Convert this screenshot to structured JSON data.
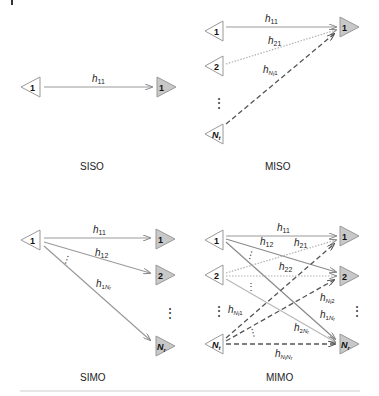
{
  "colors": {
    "tx_fill": "#ffffff",
    "rx_fill": "#c8c8c8",
    "stroke": "#888888",
    "solid_line": "#9a9a9a",
    "dotted_line": "#b0b0b0",
    "dashed_line": "#555555",
    "text": "#222222"
  },
  "panels": {
    "siso": {
      "caption": "SISO",
      "tx": [
        "1"
      ],
      "rx": [
        "1"
      ],
      "links": [
        {
          "label": "h",
          "sub": "11",
          "style": "solid"
        }
      ]
    },
    "miso": {
      "caption": "MISO",
      "tx": [
        "1",
        "2",
        "N",
        "t"
      ],
      "rx": [
        "1"
      ],
      "links": [
        {
          "label": "h",
          "sub": "11",
          "style": "solid"
        },
        {
          "label": "h",
          "sub": "21",
          "style": "dotted"
        },
        {
          "label": "h",
          "sub": "Nt1",
          "style": "dashed"
        }
      ]
    },
    "simo": {
      "caption": "SIMO",
      "tx": [
        "1"
      ],
      "rx": [
        "1",
        "2",
        "N",
        "r"
      ],
      "links": [
        {
          "label": "h",
          "sub": "11",
          "style": "solid"
        },
        {
          "label": "h",
          "sub": "12",
          "style": "solid"
        },
        {
          "label": "h",
          "sub": "1Nr",
          "style": "solid"
        }
      ]
    },
    "mimo": {
      "caption": "MIMO",
      "tx": [
        "1",
        "2",
        "N",
        "t"
      ],
      "rx": [
        "1",
        "2",
        "N",
        "r"
      ],
      "links": [
        {
          "label": "h",
          "sub": "11"
        },
        {
          "label": "h",
          "sub": "12"
        },
        {
          "label": "h",
          "sub": "21"
        },
        {
          "label": "h",
          "sub": "22"
        },
        {
          "label": "h",
          "sub": "Nt1"
        },
        {
          "label": "h",
          "sub": "Nt2"
        },
        {
          "label": "h",
          "sub": "1Nr"
        },
        {
          "label": "h",
          "sub": "2Nr"
        },
        {
          "label": "h",
          "sub": "NtNr"
        }
      ]
    }
  },
  "text": {
    "h": "h",
    "s11": "11",
    "s12": "12",
    "s21": "21",
    "s22": "22",
    "one": "1",
    "two": "2",
    "N": "N",
    "t": "t",
    "r": "r",
    "siso": "SISO",
    "miso": "MISO",
    "simo": "SIMO",
    "mimo": "MIMO",
    "ellipsis": "⋮"
  }
}
